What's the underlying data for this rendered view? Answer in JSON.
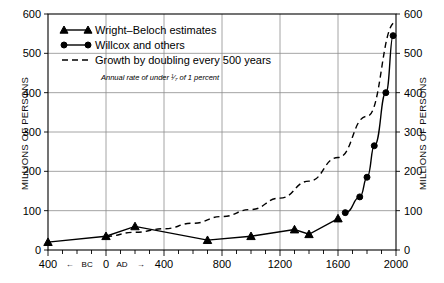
{
  "chart_data": {
    "type": "line",
    "title": "",
    "xlabel": "",
    "ylabel": "MILLIONS OF PERSONS",
    "ylabel_right": "MILLIONS OF PERSONS",
    "xlim": [
      -400,
      2000
    ],
    "ylim": [
      0,
      600
    ],
    "grid": true,
    "legend_position": "top-left",
    "y_ticks": [
      0,
      100,
      200,
      300,
      400,
      500,
      600
    ],
    "y_tick_labels": [
      "0",
      "100",
      "200",
      "300",
      "400",
      "500",
      "600"
    ],
    "y_ticks_right": [
      0,
      100,
      200,
      300,
      400,
      500,
      600
    ],
    "y_tick_labels_right": [
      "0",
      "100",
      "200",
      "300",
      "400",
      "500",
      "600"
    ],
    "x_ticks": [
      -400,
      0,
      400,
      800,
      1200,
      1600,
      2000
    ],
    "x_tick_labels": [
      "400",
      "0",
      "400",
      "800",
      "1200",
      "1600",
      "2000"
    ],
    "x_minor_tick_interval": 100,
    "era_markers": [
      {
        "label": "←",
        "x": -250
      },
      {
        "label": "BC",
        "x": -130
      },
      {
        "label": "AD",
        "x": 110
      },
      {
        "label": "→",
        "x": 240
      }
    ],
    "annotations": [
      "Annual rate of under 1/7 of 1 percent"
    ],
    "series": [
      {
        "name": "Wright–Beloch estimates",
        "marker": "triangle",
        "style": "solid",
        "x": [
          -400,
          0,
          200,
          700,
          1000,
          1300,
          1400,
          1600
        ],
        "values": [
          20,
          35,
          60,
          25,
          35,
          52,
          40,
          80
        ]
      },
      {
        "name": "Willcox and others",
        "marker": "circle",
        "style": "solid",
        "x": [
          1650,
          1750,
          1800,
          1850,
          1930,
          1980
        ],
        "values": [
          95,
          135,
          185,
          265,
          400,
          545
        ]
      },
      {
        "name": "Growth by doubling every 500 years",
        "marker": "none",
        "style": "dashed",
        "x": [
          0,
          200,
          400,
          600,
          800,
          1000,
          1200,
          1400,
          1600,
          1800,
          2000
        ],
        "values": [
          35,
          45,
          54,
          68,
          85,
          103,
          132,
          175,
          235,
          340,
          580
        ]
      }
    ]
  },
  "legend": {
    "items": [
      {
        "label": "Wright–Beloch estimates",
        "marker": "triangle",
        "style": "solid"
      },
      {
        "label": "Willcox and others",
        "marker": "circle",
        "style": "solid"
      },
      {
        "label": "Growth by doubling every 500 years",
        "marker": "none",
        "style": "dashed"
      }
    ],
    "note": "Annual rate of under 1/7 of 1 percent",
    "note_fraction_numerator": "1",
    "note_fraction_denominator": "7"
  },
  "axes": {
    "left_title": "MILLIONS OF PERSONS",
    "right_title": "MILLIONS OF PERSONS"
  }
}
